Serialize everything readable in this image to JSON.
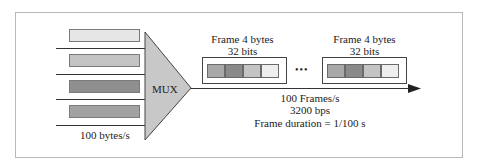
{
  "diagram": {
    "inputs": {
      "rate_label": "100 bytes/s",
      "bars": [
        {
          "color": "#e6e6e6"
        },
        {
          "color": "#c4c4c4"
        },
        {
          "color": "#8f8f8f"
        },
        {
          "color": "#a2a2a2"
        }
      ]
    },
    "mux": {
      "label": "MUX",
      "fill": "#c8c8c8"
    },
    "frames": [
      {
        "title": "Frame  4 bytes",
        "subtitle": "32 bits",
        "cells": [
          "#a8a8a8",
          "#8a8a8a",
          "#c4c4c4",
          "#eeeeee"
        ]
      },
      {
        "title": "Frame  4 bytes",
        "subtitle": "32 bits",
        "cells": [
          "#a8a8a8",
          "#8a8a8a",
          "#c4c4c4",
          "#eeeeee"
        ]
      }
    ],
    "ellipsis": "•••",
    "output": {
      "frame_rate": "100 Frames/s",
      "bit_rate": "3200 bps",
      "frame_duration": "Frame duration = 1/100 s"
    }
  }
}
